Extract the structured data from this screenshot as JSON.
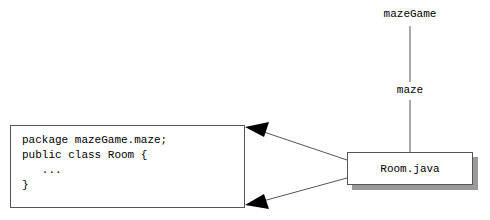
{
  "diagram": {
    "title": "",
    "package_tree": {
      "root_label": "mazeGame",
      "child_label": "maze"
    },
    "file_node": {
      "label": "Room.java"
    },
    "code_box": {
      "lines": [
        "package mazeGame.maze;",
        "public class Room {",
        "   ...",
        "}"
      ],
      "text": "package mazeGame.maze;\npublic class Room {\n   ...\n}"
    },
    "connectors": {
      "package_link_label": "",
      "arrow_count": 2,
      "arrow_direction": "file-to-code"
    },
    "colors": {
      "background": "#ffffff",
      "stroke": "#555555",
      "text": "#000000",
      "shadow": "#9a9a9a",
      "arrowhead": "#000000"
    }
  }
}
